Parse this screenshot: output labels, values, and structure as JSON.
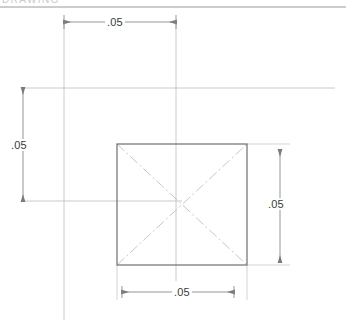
{
  "drawing": {
    "title": "Square part dimension drawing",
    "unit_note": "",
    "colors": {
      "object_line": "#6f6f6f",
      "thin_line": "#bdbdbd",
      "center_line": "#c4c4c4",
      "dimension_line": "#8a8a8a",
      "text": "#3a3a3a",
      "background": "#ffffff",
      "header_line": "#9a9a9a",
      "faint_text": "#c9c9c9"
    },
    "header": {
      "clipped_text": "DRAWING"
    },
    "shape": {
      "name": "square",
      "left": 117,
      "top": 144,
      "right": 247,
      "bottom": 265,
      "center_x": 182,
      "center_y": 204
    },
    "dimensions": [
      {
        "id": "top",
        "label": ".05",
        "orientation": "horizontal",
        "line_y": 22,
        "start_x": 64,
        "end_x": 176,
        "text_x": 105,
        "text_y": 16
      },
      {
        "id": "left",
        "label": ".05",
        "orientation": "vertical",
        "line_x": 23,
        "start_y": 88,
        "end_y": 201,
        "text_x": 9,
        "text_y": 139
      },
      {
        "id": "right",
        "label": ".05",
        "orientation": "vertical",
        "line_x": 280,
        "start_y": 150,
        "end_y": 262,
        "text_x": 266,
        "text_y": 198
      },
      {
        "id": "bottom",
        "label": ".05",
        "orientation": "horizontal",
        "line_y": 292,
        "start_x": 122,
        "end_x": 234,
        "text_x": 172,
        "text_y": 286
      }
    ],
    "construction_lines": [
      {
        "id": "upper-horizontal",
        "x1": 22,
        "y1": 88,
        "x2": 335,
        "y2": 88
      },
      {
        "id": "mid-horizontal",
        "x1": 22,
        "y1": 201,
        "x2": 182,
        "y2": 201
      },
      {
        "id": "left-vertical",
        "x1": 64,
        "y1": 22,
        "x2": 64,
        "y2": 320
      },
      {
        "id": "right-vertical",
        "x1": 176,
        "y1": 22,
        "x2": 176,
        "y2": 281
      },
      {
        "id": "top-header",
        "x1": 0,
        "y1": 7,
        "x2": 346,
        "y2": 7
      }
    ],
    "center_lines": [
      {
        "id": "diagonal-tl-br",
        "x1": 117,
        "y1": 144,
        "x2": 247,
        "y2": 265
      },
      {
        "id": "diagonal-bl-tr",
        "x1": 117,
        "y1": 265,
        "x2": 247,
        "y2": 144
      }
    ]
  }
}
